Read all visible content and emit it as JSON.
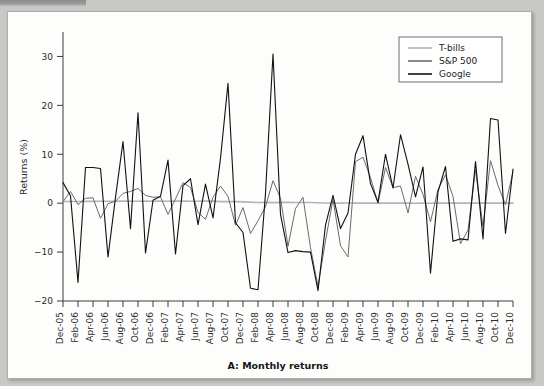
{
  "figure": {
    "caption": "A: Monthly returns",
    "ylabel": "Returns (%)"
  },
  "legend": {
    "position": "top-right",
    "items": [
      {
        "label": "T-bills",
        "color": "#b4b4b4"
      },
      {
        "label": "S&P 500",
        "color": "#6b6b6b"
      },
      {
        "label": "Google",
        "color": "#111111"
      }
    ]
  },
  "chart_data": {
    "type": "line",
    "title": "A: Monthly returns",
    "xlabel": "",
    "ylabel": "Returns (%)",
    "ylim": [
      -20,
      35
    ],
    "yticks": [
      -20,
      -10,
      0,
      10,
      20,
      30
    ],
    "grid": false,
    "legend_position": "top right",
    "x_tick_labels": [
      "Dec-05",
      "Feb-06",
      "Apr-06",
      "Jun-06",
      "Aug-06",
      "Oct-06",
      "Dec-06",
      "Feb-07",
      "Apr-07",
      "Jun-07",
      "Aug-07",
      "Oct-07",
      "Dec-07",
      "Feb-08",
      "Apr-08",
      "Jun-08",
      "Aug-08",
      "Oct-08",
      "Dec-08",
      "Feb-09",
      "Apr-09",
      "Jun-09",
      "Aug-09",
      "Oct-09",
      "Dec-09",
      "Feb-10",
      "Apr-10",
      "Jun-10",
      "Aug-10",
      "Oct-10",
      "Dec-10"
    ],
    "x": [
      "Dec-05",
      "Jan-06",
      "Feb-06",
      "Mar-06",
      "Apr-06",
      "May-06",
      "Jun-06",
      "Jul-06",
      "Aug-06",
      "Sep-06",
      "Oct-06",
      "Nov-06",
      "Dec-06",
      "Jan-07",
      "Feb-07",
      "Mar-07",
      "Apr-07",
      "May-07",
      "Jun-07",
      "Jul-07",
      "Aug-07",
      "Sep-07",
      "Oct-07",
      "Nov-07",
      "Dec-07",
      "Jan-08",
      "Feb-08",
      "Mar-08",
      "Apr-08",
      "May-08",
      "Jun-08",
      "Jul-08",
      "Aug-08",
      "Sep-08",
      "Oct-08",
      "Nov-08",
      "Dec-08",
      "Jan-09",
      "Feb-09",
      "Mar-09",
      "Apr-09",
      "May-09",
      "Jun-09",
      "Jul-09",
      "Aug-09",
      "Sep-09",
      "Oct-09",
      "Nov-09",
      "Dec-09",
      "Jan-10",
      "Feb-10",
      "Mar-10",
      "Apr-10",
      "May-10",
      "Jun-10",
      "Jul-10",
      "Aug-10",
      "Sep-10",
      "Oct-10",
      "Nov-10",
      "Dec-10"
    ],
    "series": [
      {
        "name": "Google",
        "color": "#111111",
        "values": [
          4.2,
          1.5,
          -16.2,
          7.3,
          7.3,
          7.1,
          -11.0,
          1.2,
          12.6,
          -5.2,
          18.5,
          -10.2,
          0.6,
          1.4,
          8.8,
          -10.4,
          3.6,
          5.0,
          -4.4,
          3.9,
          -3.0,
          9.2,
          24.5,
          -4.0,
          -6.0,
          -17.4,
          -17.7,
          2.0,
          30.5,
          -2.3,
          -10.1,
          -9.7,
          -9.9,
          -10.0,
          -17.9,
          -4.5,
          1.6,
          -5.2,
          -2.0,
          10.0,
          13.8,
          4.0,
          0.2,
          10.0,
          3.1,
          14.0,
          8.0,
          1.3,
          7.4,
          -14.3,
          2.3,
          7.5,
          -7.8,
          -7.3,
          -7.5,
          8.5,
          -7.3,
          17.3,
          17.0,
          -6.2,
          7.0
        ]
      },
      {
        "name": "S&P 500",
        "color": "#6b6b6b",
        "values": [
          0.3,
          2.4,
          -0.3,
          1.0,
          1.1,
          -3.1,
          -0.1,
          0.4,
          2.0,
          2.4,
          3.0,
          1.6,
          1.2,
          1.3,
          -2.3,
          0.9,
          4.2,
          3.2,
          -1.9,
          -3.3,
          1.2,
          3.5,
          1.4,
          -4.5,
          -0.9,
          -6.2,
          -3.6,
          -0.7,
          4.6,
          1.0,
          -8.8,
          -1.1,
          1.2,
          -9.1,
          -17.0,
          -7.7,
          0.8,
          -8.7,
          -11.0,
          8.5,
          9.4,
          5.2,
          0.0,
          7.3,
          3.2,
          3.5,
          -2.0,
          5.5,
          1.8,
          -3.8,
          2.8,
          5.8,
          1.4,
          -8.3,
          -5.5,
          6.8,
          -4.8,
          8.7,
          3.6,
          -0.3,
          6.4
        ]
      },
      {
        "name": "T-bills",
        "color": "#b4b4b4",
        "values": [
          0.33,
          0.35,
          0.34,
          0.37,
          0.37,
          0.39,
          0.4,
          0.41,
          0.42,
          0.41,
          0.41,
          0.42,
          0.41,
          0.44,
          0.41,
          0.43,
          0.44,
          0.41,
          0.4,
          0.42,
          0.42,
          0.32,
          0.32,
          0.34,
          0.27,
          0.21,
          0.13,
          0.17,
          0.11,
          0.18,
          0.17,
          0.15,
          0.13,
          0.15,
          0.08,
          0.03,
          0.0,
          0.02,
          0.03,
          0.02,
          0.01,
          0.01,
          0.02,
          0.02,
          0.01,
          0.01,
          0.01,
          0.0,
          0.01,
          0.0,
          0.01,
          0.01,
          0.01,
          0.01,
          0.01,
          0.01,
          0.01,
          0.01,
          0.01,
          0.01,
          0.01
        ]
      }
    ]
  }
}
